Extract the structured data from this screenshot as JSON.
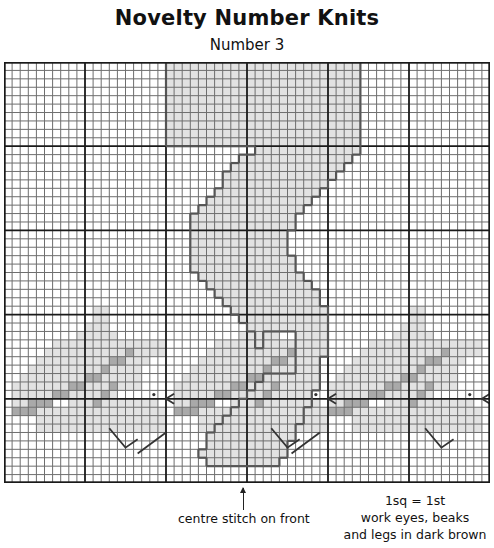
{
  "header": {
    "title": "Novelty Number Knits",
    "subtitle": "Number 3"
  },
  "chart": {
    "cols": 60,
    "rows": 50,
    "major_every": 10,
    "colors": {
      "background": "#ffffff",
      "minor_line": "#6e6e6e",
      "major_line": "#1a1a1a",
      "light_fill": "#e2e2e2",
      "dark_fill": "#a9a9a9",
      "outline": "#555555",
      "detail": "#333333"
    },
    "number_3_spans": [
      [
        0,
        20,
        43
      ],
      [
        1,
        20,
        43
      ],
      [
        2,
        20,
        43
      ],
      [
        3,
        20,
        43
      ],
      [
        4,
        20,
        43
      ],
      [
        5,
        20,
        43
      ],
      [
        6,
        20,
        43
      ],
      [
        7,
        20,
        43
      ],
      [
        8,
        20,
        43
      ],
      [
        9,
        20,
        43
      ],
      [
        10,
        31,
        43
      ],
      [
        11,
        29,
        42
      ],
      [
        12,
        28,
        41
      ],
      [
        13,
        27,
        40
      ],
      [
        14,
        27,
        39
      ],
      [
        15,
        26,
        38
      ],
      [
        16,
        25,
        37
      ],
      [
        17,
        24,
        36
      ],
      [
        18,
        23,
        35
      ],
      [
        19,
        23,
        35
      ],
      [
        20,
        23,
        34
      ],
      [
        21,
        23,
        34
      ],
      [
        22,
        23,
        34
      ],
      [
        23,
        23,
        35
      ],
      [
        24,
        23,
        35
      ],
      [
        25,
        24,
        36
      ],
      [
        26,
        25,
        37
      ],
      [
        27,
        26,
        38
      ],
      [
        28,
        27,
        38
      ],
      [
        29,
        28,
        39
      ],
      [
        30,
        29,
        39
      ],
      [
        31,
        30,
        39
      ],
      [
        32,
        31,
        39
      ],
      [
        33,
        31,
        39
      ],
      [
        34,
        32,
        39
      ],
      [
        35,
        32,
        38
      ],
      [
        36,
        32,
        38
      ],
      [
        37,
        32,
        38
      ],
      [
        38,
        31,
        38
      ],
      [
        39,
        30,
        37
      ],
      [
        40,
        29,
        37
      ],
      [
        41,
        28,
        36
      ],
      [
        42,
        27,
        36
      ],
      [
        43,
        26,
        35
      ],
      [
        44,
        25,
        35
      ],
      [
        45,
        25,
        34
      ],
      [
        46,
        24,
        34
      ],
      [
        47,
        25,
        33
      ]
    ],
    "number_3_hole_spans": [
      [
        32,
        32,
        35
      ],
      [
        33,
        32,
        35
      ],
      [
        34,
        32,
        35
      ],
      [
        35,
        32,
        35
      ],
      [
        36,
        32,
        35
      ]
    ],
    "birds": [
      {
        "name": "left",
        "light_spans": [
          [
            29,
            20,
            21
          ],
          [
            30,
            20,
            21
          ],
          [
            31,
            19,
            21
          ],
          [
            32,
            18,
            22
          ],
          [
            33,
            15,
            28
          ],
          [
            34,
            14,
            28
          ],
          [
            35,
            13,
            26
          ],
          [
            36,
            12,
            25
          ],
          [
            37,
            11,
            25
          ],
          [
            38,
            10,
            25
          ],
          [
            39,
            10,
            15
          ],
          [
            39,
            17,
            22
          ],
          [
            40,
            10,
            13
          ],
          [
            40,
            17,
            27
          ],
          [
            41,
            11,
            28
          ],
          [
            42,
            13,
            28
          ],
          [
            43,
            13,
            28
          ]
        ],
        "dark_cells": [
          [
            34,
            24
          ],
          [
            35,
            23
          ],
          [
            35,
            22
          ],
          [
            36,
            21
          ],
          [
            37,
            20
          ],
          [
            37,
            19
          ],
          [
            38,
            18
          ],
          [
            38,
            17
          ],
          [
            39,
            16
          ],
          [
            39,
            15
          ],
          [
            40,
            14
          ],
          [
            40,
            13
          ],
          [
            40,
            12
          ],
          [
            41,
            12
          ],
          [
            41,
            11
          ],
          [
            41,
            10
          ],
          [
            38,
            22
          ],
          [
            39,
            21
          ],
          [
            40,
            20
          ]
        ],
        "eye": [
          40,
          27
        ],
        "beak": [
          41,
          29
        ],
        "tail_leg": [
          [
            42,
            1
          ],
          [
            44,
            1
          ]
        ],
        "leg": [
          [
            45,
            9
          ],
          [
            47,
            5
          ]
        ]
      }
    ],
    "centre_col": 30
  },
  "footer": {
    "arrow_label": "centre stitch on front",
    "legend_lines": [
      "1sq = 1st",
      "work eyes, beaks",
      "and legs in dark brown"
    ]
  }
}
